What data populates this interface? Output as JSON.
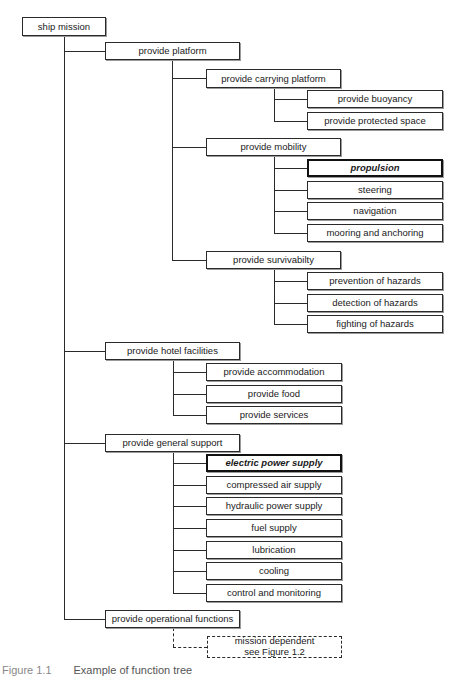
{
  "diagram": {
    "root": "ship mission",
    "level1": [
      "provide platform",
      "provide hotel facilities",
      "provide general support",
      "provide operational functions"
    ],
    "platform": {
      "children": [
        "provide carrying platform",
        "provide mobility",
        "provide survivabilty"
      ],
      "carrying": [
        "provide buoyancy",
        "provide protected space"
      ],
      "mobility": [
        "propulsion",
        "steering",
        "navigation",
        "mooring and anchoring"
      ],
      "survivability": [
        "prevention of hazards",
        "detection of hazards",
        "fighting of hazards"
      ]
    },
    "hotel": [
      "provide accommodation",
      "provide food",
      "provide services"
    ],
    "support": [
      "electric power supply",
      "compressed air supply",
      "hydraulic power supply",
      "fuel supply",
      "lubrication",
      "cooling",
      "control and monitoring"
    ],
    "operational": {
      "line1": "mission dependent",
      "line2": "see Figure 1.2"
    },
    "highlighted": [
      "propulsion",
      "electric power supply"
    ]
  },
  "caption": {
    "label": "Figure 1.1",
    "text": "Example of function tree"
  }
}
